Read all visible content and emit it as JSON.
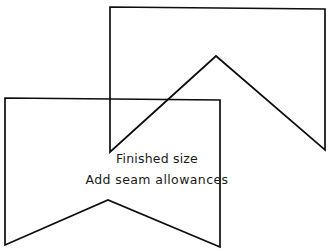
{
  "figure": {
    "background_color": "#ffffff",
    "line_color": "#0d0d0d",
    "line_width": 1.7,
    "width": 330,
    "height": 251
  },
  "caption": {
    "line1": "Finished size",
    "line2": "Add seam allowances"
  },
  "shapes": [
    {
      "name": "upper-bowtie",
      "description": "hourglass / bow tie shape, upper right",
      "points": "110,7 325,9 325,150 216,56 110,152"
    },
    {
      "name": "lower-bowtie",
      "description": "hourglass / bow tie shape, lower left",
      "points": "5,98 220,100 220,247 108,200 5,245"
    }
  ]
}
